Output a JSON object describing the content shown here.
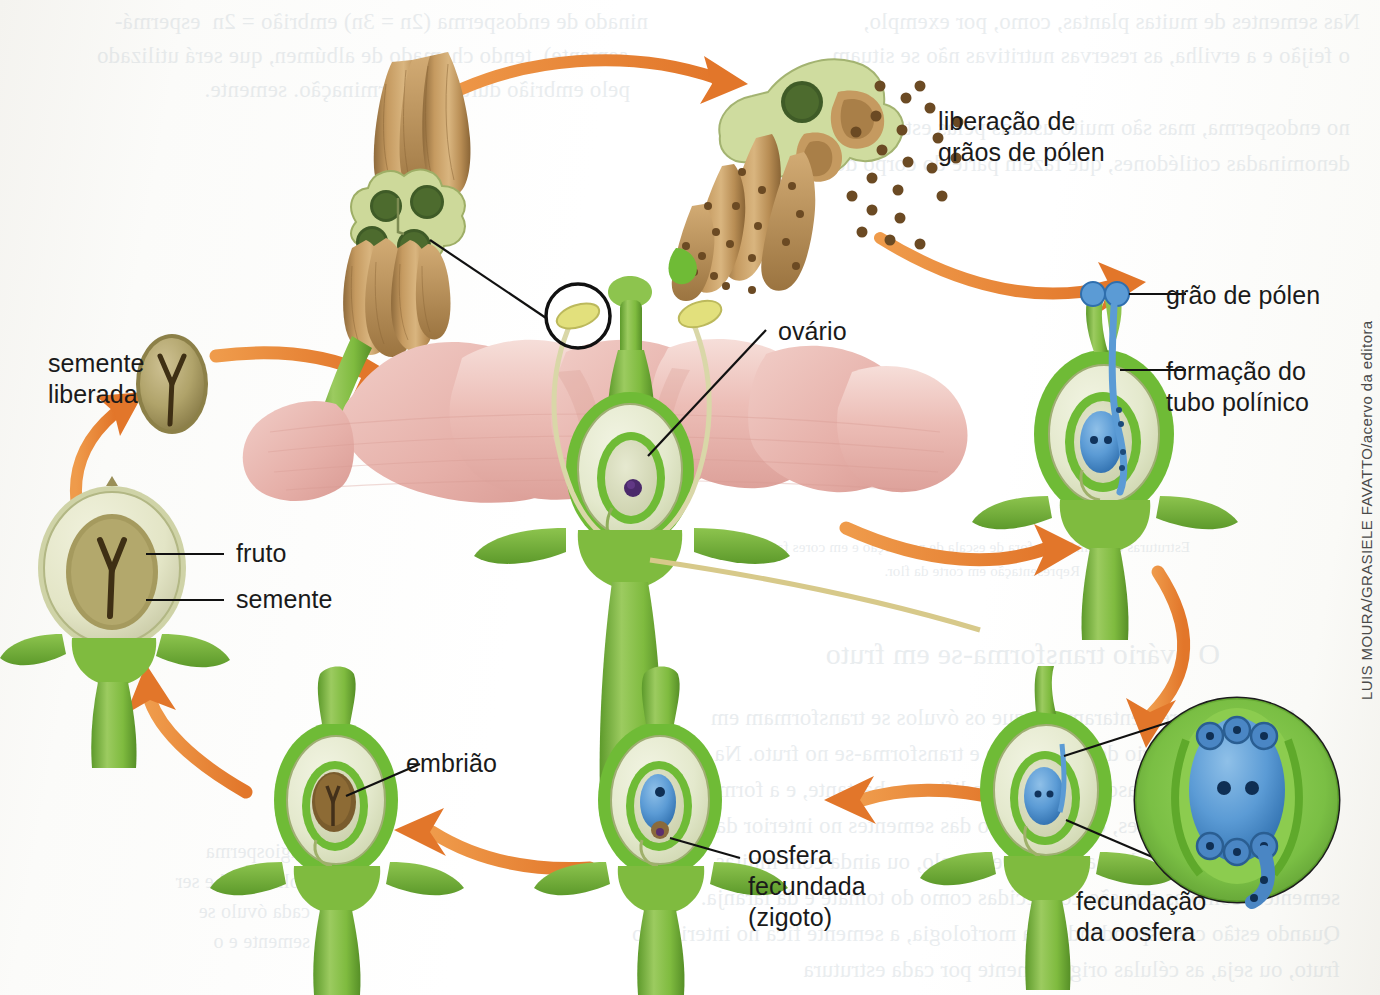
{
  "figure": {
    "kind": "botanical-diagram",
    "credit": "LUIS MOURA/GRASIELE FAVATTO/acervo da editora"
  },
  "labels": {
    "pollen_release": "liberação de\ngrãos de pólen",
    "pollen_grain": "grão de pólen",
    "pollen_tube": "formação do\ntubo polínico",
    "ovary": "ovário",
    "seed_released": "semente\nliberada",
    "fruit": "fruto",
    "seed": "semente",
    "embryo": "embrião",
    "fertilized_oosphere": "oosfera\nfecundada\n(zigoto)",
    "oosphere_fertilization": "fecundação\nda oosfera"
  },
  "colors": {
    "petal_light": "#f3d4cf",
    "petal_mid": "#e9b4ad",
    "petal_dark": "#dda19a",
    "stem_green": "#7fbb3f",
    "stem_green_dark": "#5e9a2c",
    "ovary_pale": "#e8ecd2",
    "ovule_inner": "#d9debd",
    "anther_tan": "#bb9258",
    "anther_tan_dark": "#9a7340",
    "pollen_dot": "#6b4a23",
    "arrow_orange": "#e8812e",
    "arrow_orange_light": "#ef9c4c",
    "embryo_sac_blue": "#5b9bd5",
    "embryo_sac_blue_dark": "#2e6fab",
    "seed_coat": "#8d7c45",
    "seed_body": "#b8ab72",
    "embryo_brown": "#5a4424",
    "nucleus_purple": "#4b2a6b",
    "leader_line": "#111111",
    "label_text": "#1a1a1a",
    "background": "#fdfdfb"
  },
  "bleed_text": {
    "note": "texto transparecido do verso da página (espelhado, ilegível)",
    "lines_top": [
      "ninado de endosperma (2n = 3n) embrião = 2n  espermá-",
      "semente), tendo chamado de albúmen, que será utilizado",
      "pelo embrião durante a germinação. semente.",
      "Nas sementes de muitas plantas, como, por exemplo,",
      "o feijão e a ervilha, as reservas nutritivas não se situam",
      "no endosperma, mas são muito usadas pelas estruturas volumosas",
      "denominadas cotilédones, que fazem parte do corpo do embrião."
    ],
    "lines_mid": [
      "Estruturas esquemáticas, fora de escala de proporção e em cores fantasia.",
      "Representação em corte da flor."
    ],
    "lines_lower": [
      "O ovário transforma-se em fruto",
      "A mesma incrementaram em que os óvulos se transformam em",
      "sementes, o ovário desenvolve-se e transforma-se no fruto. Na",
      "maior parte dos casos, o ovário modifica-se bastante, e a forma do",
      "fruto e de sementes, como no caso das sementes no interior da flor de ba-",
      "nanas, abacate e de manga, por exemplo, ou ainda com muitas",
      "sementes, como as que são conhecidas como do tomate e da laranja.",
      "Quando estão correspondendo, na morfologia, a semente fica no interior do",
      "fruto, ou seja, as células originalmente por cada estrutura"
    ]
  }
}
